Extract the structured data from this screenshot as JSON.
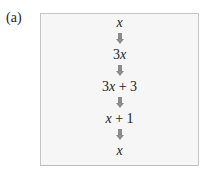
{
  "figure": {
    "label": "(a)",
    "steps": [
      {
        "pre": "",
        "var": "x",
        "post": ""
      },
      {
        "pre": "3",
        "var": "x",
        "post": ""
      },
      {
        "pre": "3",
        "var": "x",
        "post": " + 3"
      },
      {
        "pre": "",
        "var": "x",
        "post": " + 1"
      },
      {
        "pre": "",
        "var": "x",
        "post": ""
      }
    ],
    "arrow_icon": "down-arrow-icon",
    "colors": {
      "box_fill": "#f6f6f6",
      "box_border": "#c4c4c4",
      "arrow": "#8c8c8c",
      "text": "#222222"
    }
  }
}
